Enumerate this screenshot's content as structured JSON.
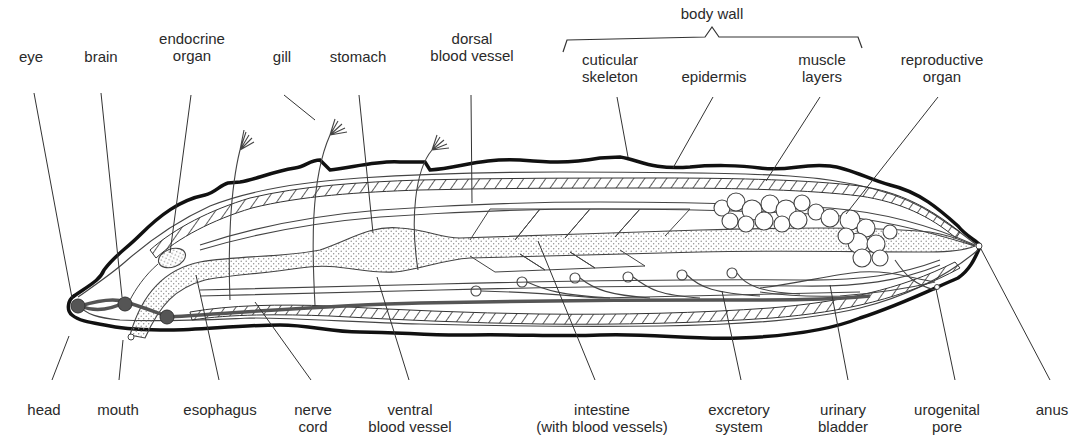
{
  "diagram": {
    "group_labels": {
      "body_wall": "body wall"
    },
    "top_labels": [
      {
        "id": "eye",
        "lines": [
          "eye"
        ],
        "x": 31,
        "y": 48
      },
      {
        "id": "brain",
        "lines": [
          "brain"
        ],
        "x": 101,
        "y": 48
      },
      {
        "id": "endocrine-organ",
        "lines": [
          "endocrine",
          "organ"
        ],
        "x": 192,
        "y": 30
      },
      {
        "id": "gill",
        "lines": [
          "gill"
        ],
        "x": 282,
        "y": 48
      },
      {
        "id": "stomach",
        "lines": [
          "stomach"
        ],
        "x": 358,
        "y": 48
      },
      {
        "id": "dorsal-blood-vessel",
        "lines": [
          "dorsal",
          "blood vessel"
        ],
        "x": 472,
        "y": 30
      },
      {
        "id": "cuticular-skeleton",
        "lines": [
          "cuticular",
          "skeleton"
        ],
        "x": 610,
        "y": 51
      },
      {
        "id": "epidermis",
        "lines": [
          "epidermis"
        ],
        "x": 714,
        "y": 68
      },
      {
        "id": "muscle-layers",
        "lines": [
          "muscle",
          "layers"
        ],
        "x": 822,
        "y": 51
      },
      {
        "id": "reproductive-organ",
        "lines": [
          "reproductive",
          "organ"
        ],
        "x": 942,
        "y": 51
      }
    ],
    "bottom_labels": [
      {
        "id": "head",
        "lines": [
          "head"
        ],
        "x": 44,
        "y": 401
      },
      {
        "id": "mouth",
        "lines": [
          "mouth"
        ],
        "x": 118,
        "y": 401
      },
      {
        "id": "esophagus",
        "lines": [
          "esophagus"
        ],
        "x": 220,
        "y": 401
      },
      {
        "id": "nerve-cord",
        "lines": [
          "nerve",
          "cord"
        ],
        "x": 313,
        "y": 401
      },
      {
        "id": "ventral-blood-vessel",
        "lines": [
          "ventral",
          "blood vessel"
        ],
        "x": 410,
        "y": 401
      },
      {
        "id": "intestine",
        "lines": [
          "intestine",
          "(with blood vessels)"
        ],
        "x": 602,
        "y": 401
      },
      {
        "id": "excretory-system",
        "lines": [
          "excretory",
          "system"
        ],
        "x": 739,
        "y": 401
      },
      {
        "id": "urinary-bladder",
        "lines": [
          "urinary",
          "bladder"
        ],
        "x": 843,
        "y": 401
      },
      {
        "id": "urogenital-pore",
        "lines": [
          "urogenital",
          "pore"
        ],
        "x": 947,
        "y": 401
      },
      {
        "id": "anus",
        "lines": [
          "anus"
        ],
        "x": 1052,
        "y": 401
      }
    ],
    "colors": {
      "outline": "#111111",
      "line": "#444444",
      "ganglion": "#555555",
      "stipple": "#9a9a9a",
      "text": "#2a2a2a"
    }
  }
}
